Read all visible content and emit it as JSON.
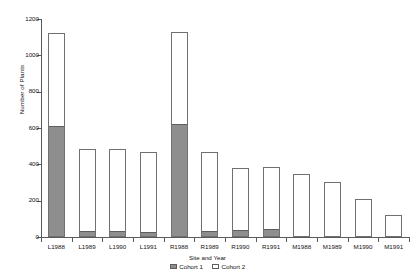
{
  "chart_data": {
    "type": "bar",
    "stacked": true,
    "title": "",
    "xlabel": "Site and Year",
    "ylabel": "Number of Plants",
    "ylim": [
      0,
      1200
    ],
    "ytick_labels": [
      "0",
      "200",
      "400",
      "600",
      "800",
      "1000",
      "1200"
    ],
    "ytick_values": [
      0,
      200,
      400,
      600,
      800,
      1000,
      1200
    ],
    "grid": false,
    "legend_position": "bottom-center",
    "categories": [
      "L1988",
      "L1989",
      "L1990",
      "L1991",
      "R1988",
      "R1989",
      "R1990",
      "R1991",
      "M1988",
      "M1989",
      "M1990",
      "M1991"
    ],
    "series": [
      {
        "name": "Cohort 1",
        "color": "#8e8e8e",
        "values": [
          605,
          25,
          25,
          20,
          617,
          30,
          35,
          40,
          0,
          0,
          0,
          0
        ]
      },
      {
        "name": "Cohort 2",
        "color": "#ffffff",
        "values": [
          518,
          459,
          459,
          448,
          509,
          440,
          346,
          345,
          347,
          303,
          209,
          121
        ]
      }
    ],
    "totals": [
      1123,
      484,
      484,
      468,
      1126,
      470,
      381,
      385,
      347,
      303,
      209,
      121
    ]
  },
  "legend": {
    "entries": [
      {
        "label": "Cohort 1",
        "swatch": "filled"
      },
      {
        "label": "Cohort 2",
        "swatch": "empty"
      }
    ]
  }
}
